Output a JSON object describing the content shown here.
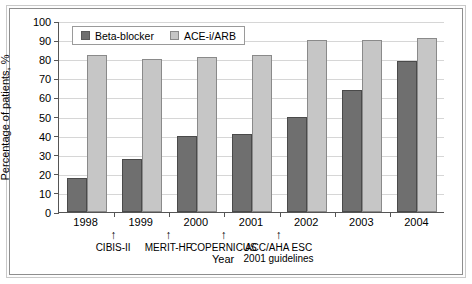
{
  "chart_data": {
    "type": "bar",
    "title": "",
    "subtitle": "",
    "xlabel": "Year",
    "ylabel": "Percentage of patients, %",
    "categories": [
      "1998",
      "1999",
      "2000",
      "2001",
      "2002",
      "2003",
      "2004"
    ],
    "series": [
      {
        "name": "Beta-blocker",
        "color": "#6f6f6f",
        "values": [
          18,
          28,
          40,
          41,
          50,
          64,
          79
        ]
      },
      {
        "name": "ACE-i/ARB",
        "color": "#c6c6c6",
        "values": [
          82,
          80,
          81,
          82,
          90,
          90,
          91
        ]
      }
    ],
    "ylim": [
      0,
      100
    ],
    "ytick_labels": [
      "100",
      "90",
      "80",
      "70",
      "60",
      "50",
      "40",
      "30",
      "20",
      "10",
      "0"
    ],
    "ytick_values": [
      100,
      90,
      80,
      70,
      60,
      50,
      40,
      30,
      20,
      10,
      0
    ],
    "grid": true,
    "grid_axis": "y",
    "legend_position": "upper-left-inside",
    "annotations": [
      {
        "label": "CIBIS-II",
        "at_category": "1998-1999 boundary",
        "arrow": "up"
      },
      {
        "label": "MERIT-HF",
        "at_category": "1999-2000 boundary",
        "arrow": "up"
      },
      {
        "label": "COPERNICUS",
        "at_category": "2000-2001 boundary",
        "arrow": "up"
      },
      {
        "label": "ACC/AHA ESC\n2001 guidelines",
        "at_category": "2001-2002 boundary",
        "arrow": "up"
      }
    ]
  },
  "legend": {
    "items": [
      {
        "label": "Beta-blocker"
      },
      {
        "label": "ACE-i/ARB"
      }
    ]
  },
  "axes": {
    "y_title": "Percentage of patients, %",
    "x_title": "Year"
  },
  "icons": {
    "arrow_up": "↑"
  }
}
